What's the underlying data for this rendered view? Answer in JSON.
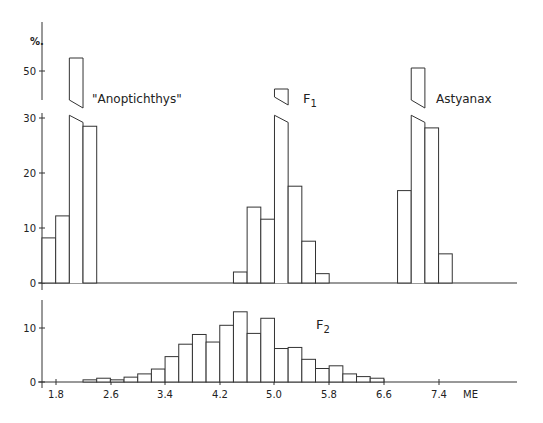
{
  "chart_data": [
    {
      "type": "bar",
      "title": "Upper panel: parental and F1 distributions",
      "ylabel": "%",
      "xlabel": "ME",
      "ylim": [
        0,
        55
      ],
      "y_ticks": [
        0,
        10,
        20,
        30,
        50
      ],
      "axis_break": [
        32,
        45
      ],
      "bin_width": 0.2,
      "series": [
        {
          "name": "\"Anoptichthys\"",
          "bins_start": [
            1.8,
            2.0,
            2.2,
            2.4
          ],
          "values": [
            8.2,
            12.2,
            52.5,
            28.5
          ]
        },
        {
          "name": "F1",
          "bins_start": [
            4.6,
            4.8,
            5.0,
            5.2,
            5.4,
            5.6,
            5.8
          ],
          "values": [
            2.0,
            13.8,
            11.6,
            46.8,
            17.6,
            7.6,
            1.7
          ]
        },
        {
          "name": "Astyanax",
          "bins_start": [
            7.0,
            7.2,
            7.4,
            7.6
          ],
          "values": [
            16.8,
            52.0,
            28.2,
            5.3
          ]
        }
      ]
    },
    {
      "type": "bar",
      "title": "Lower panel: F2 distribution",
      "ylabel": "%",
      "xlabel": "ME",
      "ylim": [
        0,
        15
      ],
      "y_ticks": [
        0,
        10
      ],
      "x_ticks": [
        "1.8",
        "2.6",
        "3.4",
        "4.2",
        "5.0",
        "5.8",
        "6.6",
        "7.4"
      ],
      "bin_width": 0.2,
      "series": [
        {
          "name": "F2",
          "bins_start": [
            2.4,
            2.6,
            2.8,
            3.0,
            3.2,
            3.4,
            3.6,
            3.8,
            4.0,
            4.2,
            4.4,
            4.6,
            4.8,
            5.0,
            5.2,
            5.4,
            5.6,
            5.8,
            6.0,
            6.2,
            6.4,
            6.6
          ],
          "values": [
            0.4,
            0.7,
            0.4,
            0.9,
            1.5,
            2.4,
            4.7,
            7.0,
            8.8,
            7.4,
            10.5,
            13.0,
            9.0,
            11.8,
            6.2,
            6.4,
            4.2,
            2.5,
            3.0,
            1.5,
            1.0,
            0.7
          ]
        }
      ]
    }
  ],
  "labels": {
    "y_unit": "%.",
    "anoptichthys": "\"Anoptichthys\"",
    "f1_main": "F",
    "f1_sub": "1",
    "astyanax": "Astyanax",
    "f2_main": "F",
    "f2_sub": "2",
    "x_unit": "ME",
    "upper_y_ticks": [
      "0",
      "10",
      "20",
      "30",
      "50"
    ],
    "lower_y_ticks": [
      "0",
      "10"
    ],
    "x_ticks": [
      "1.8",
      "2.6",
      "3.4",
      "4.2",
      "5.0",
      "5.8",
      "6.6",
      "7.4"
    ]
  }
}
